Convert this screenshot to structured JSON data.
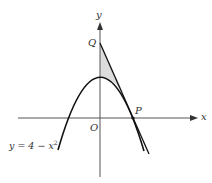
{
  "diagram": {
    "type": "graph",
    "labels": {
      "x_axis": "x",
      "y_axis": "y",
      "origin": "O",
      "point_q": "Q",
      "point_p": "P",
      "curve_eq_prefix": "y = 4 − x",
      "curve_eq_exp": "2"
    },
    "colors": {
      "axis": "#555555",
      "curve": "#111111",
      "shade": "#dcdcdc"
    }
  }
}
